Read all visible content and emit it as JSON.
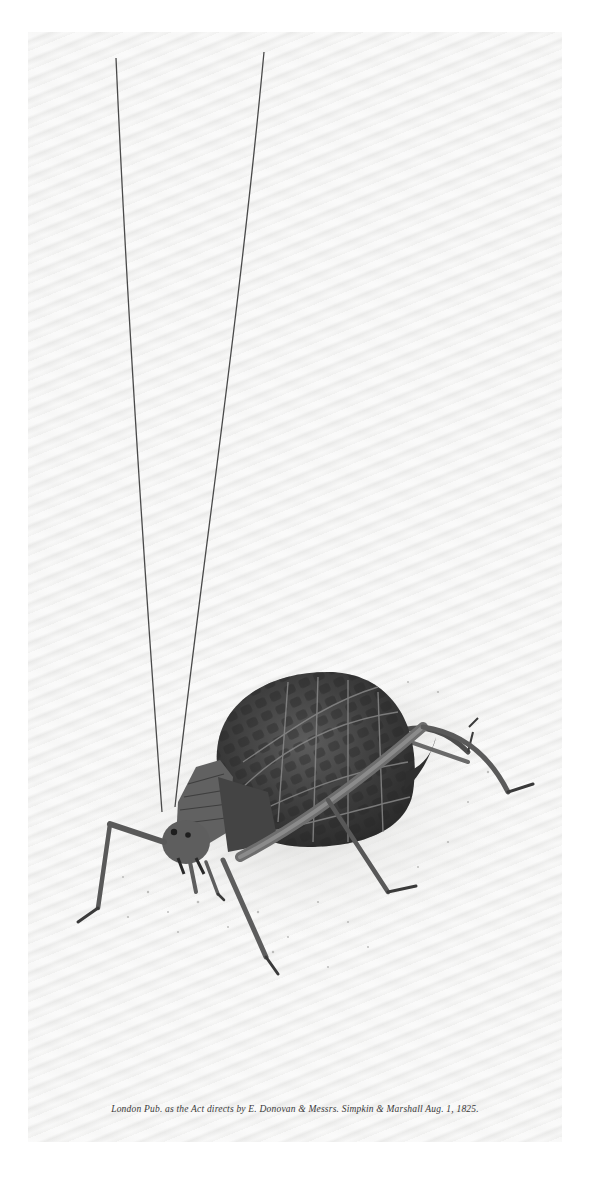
{
  "plate": {
    "subject": "Insect illustration — bush cricket (katydid) with long antennae, walking on sandy ground",
    "caption": "London Pub. as the Act directs by E. Donovan & Messrs. Simpkin & Marshall Aug. 1, 1825."
  },
  "colors": {
    "paper": "#f1f1f0",
    "ink_dark": "#2e2e2e",
    "ink_mid": "#5a5a5a",
    "ink_light": "#8a8a8a"
  }
}
